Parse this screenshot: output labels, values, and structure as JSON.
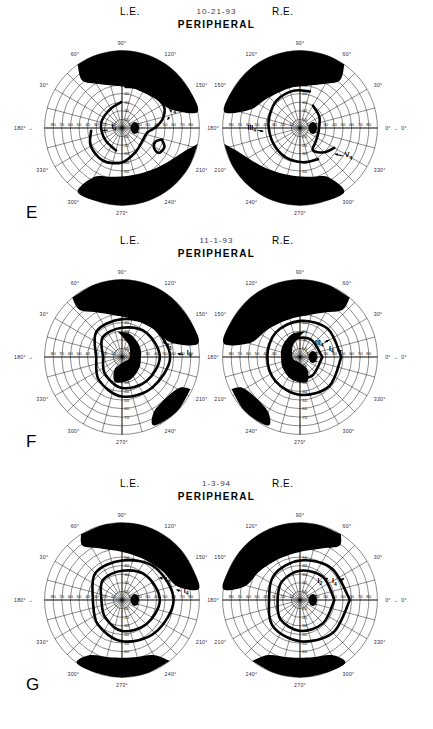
{
  "document": {
    "title": "Goldmann Kinetic Perimetry Series",
    "test_type": "PERIPHERAL",
    "eye_left_label": "L.E.",
    "eye_right_label": "R.E."
  },
  "panels": [
    {
      "letter": "E",
      "date": "10-21-93",
      "test_type": "PERIPHERAL",
      "left_eye": {
        "label": "L.E.",
        "isopter_labels": [
          {
            "name": "III",
            "sub": "4"
          },
          {
            "name": "V",
            "sub": "4"
          },
          {
            "name": "I",
            "sub": "4"
          }
        ]
      },
      "right_eye": {
        "label": "R.E.",
        "isopter_labels": [
          {
            "name": "III",
            "sub": "4"
          },
          {
            "name": "V",
            "sub": "4"
          }
        ]
      }
    },
    {
      "letter": "F",
      "date": "11-1-93",
      "test_type": "PERIPHERAL",
      "left_eye": {
        "label": "L.E.",
        "isopter_labels": [
          {
            "name": "I",
            "sub": "4"
          },
          {
            "name": "I",
            "sub": "3"
          },
          {
            "name": "I",
            "sub": "4"
          }
        ]
      },
      "right_eye": {
        "label": "R.E.",
        "isopter_labels": [
          {
            "name": "III",
            "sub": "4"
          },
          {
            "name": "I",
            "sub": "3"
          },
          {
            "name": "I",
            "sub": "4"
          }
        ]
      }
    },
    {
      "letter": "G",
      "date": "1-3-94",
      "test_type": "PERIPHERAL",
      "left_eye": {
        "label": "L.E.",
        "isopter_labels": [
          {
            "name": "I",
            "sub": "4"
          },
          {
            "name": "I",
            "sub": "2"
          }
        ]
      },
      "right_eye": {
        "label": "R.E.",
        "isopter_labels": [
          {
            "name": "I",
            "sub": "2"
          },
          {
            "name": "I",
            "sub": "4"
          }
        ]
      }
    }
  ],
  "chart_data": {
    "type": "scatter",
    "subtitle": "Serial visual fields E (10-21-93), F (11-1-93), G (1-3-94)",
    "projection": "polar",
    "radial_axis": {
      "label": "Eccentricity (degrees)",
      "ticks": [
        10,
        20,
        30,
        40,
        50,
        60,
        70,
        80,
        90
      ],
      "range": [
        0,
        90
      ],
      "ring_interval": 10
    },
    "angular_axis": {
      "label": "Meridian (degrees)",
      "ticks": [
        0,
        30,
        60,
        90,
        120,
        150,
        180,
        210,
        240,
        270,
        300,
        330
      ],
      "tick_labels": [
        "0°",
        "30°",
        "60°",
        "90°",
        "120°",
        "150°",
        "180°",
        "210°",
        "240°",
        "270°",
        "300°",
        "330°"
      ],
      "spoke_interval": 15
    },
    "meridian_markers": {
      "left_arrow_label": "180°",
      "right_arrow_label": "0°"
    },
    "legend_position": "inline-annotations",
    "grid": true,
    "series": [
      {
        "name": "E / L.E. III4",
        "panel": "E",
        "eye": "left",
        "stimulus": "III4",
        "closed": false,
        "points_deg": [
          {
            "angle": 95,
            "r": 48
          },
          {
            "angle": 120,
            "r": 52
          },
          {
            "angle": 150,
            "r": 55
          },
          {
            "angle": 165,
            "r": 50
          },
          {
            "angle": 178,
            "r": 40
          },
          {
            "angle": 190,
            "r": 30
          },
          {
            "angle": 210,
            "r": 28
          },
          {
            "angle": 240,
            "r": 32
          },
          {
            "angle": 270,
            "r": 40
          },
          {
            "angle": 300,
            "r": 44
          },
          {
            "angle": 330,
            "r": 42
          },
          {
            "angle": 355,
            "r": 36
          }
        ]
      },
      {
        "name": "E / L.E. V4 island",
        "panel": "E",
        "eye": "left",
        "stimulus": "V4",
        "closed": true,
        "points_deg": [
          {
            "angle": 196,
            "r": 48
          },
          {
            "angle": 204,
            "r": 54
          },
          {
            "angle": 214,
            "r": 52
          },
          {
            "angle": 212,
            "r": 44
          },
          {
            "angle": 202,
            "r": 42
          }
        ]
      },
      {
        "name": "E / L.E. I4",
        "panel": "E",
        "eye": "left",
        "stimulus": "I4",
        "closed": false,
        "points_deg": [
          {
            "angle": 88,
            "r": 30
          },
          {
            "angle": 60,
            "r": 26
          },
          {
            "angle": 20,
            "r": 25
          },
          {
            "angle": 350,
            "r": 24
          },
          {
            "angle": 320,
            "r": 24
          },
          {
            "angle": 285,
            "r": 27
          }
        ]
      },
      {
        "name": "E / R.E. III4",
        "panel": "E",
        "eye": "right",
        "stimulus": "III4",
        "closed": false,
        "points_deg": [
          {
            "angle": 75,
            "r": 44
          },
          {
            "angle": 100,
            "r": 44
          },
          {
            "angle": 130,
            "r": 42
          },
          {
            "angle": 160,
            "r": 38
          },
          {
            "angle": 185,
            "r": 36
          },
          {
            "angle": 215,
            "r": 36
          },
          {
            "angle": 245,
            "r": 38
          },
          {
            "angle": 275,
            "r": 40
          },
          {
            "angle": 300,
            "r": 42
          }
        ]
      },
      {
        "name": "E / R.E. V4",
        "panel": "E",
        "eye": "right",
        "stimulus": "V4",
        "closed": false,
        "points_deg": [
          {
            "angle": 60,
            "r": 30
          },
          {
            "angle": 30,
            "r": 26
          },
          {
            "angle": 350,
            "r": 22
          },
          {
            "angle": 320,
            "r": 24
          },
          {
            "angle": 300,
            "r": 30
          },
          {
            "angle": 315,
            "r": 40
          },
          {
            "angle": 330,
            "r": 46
          }
        ]
      },
      {
        "name": "F / L.E. I4 outer",
        "panel": "F",
        "eye": "left",
        "stimulus": "I4",
        "closed": true,
        "points_deg": [
          {
            "angle": 0,
            "r": 30
          },
          {
            "angle": 45,
            "r": 42
          },
          {
            "angle": 90,
            "r": 44
          },
          {
            "angle": 135,
            "r": 50
          },
          {
            "angle": 180,
            "r": 56
          },
          {
            "angle": 225,
            "r": 50
          },
          {
            "angle": 270,
            "r": 46
          },
          {
            "angle": 315,
            "r": 38
          }
        ]
      },
      {
        "name": "F / L.E. I3",
        "panel": "F",
        "eye": "left",
        "stimulus": "I3",
        "closed": true,
        "points_deg": [
          {
            "angle": 0,
            "r": 22
          },
          {
            "angle": 45,
            "r": 32
          },
          {
            "angle": 90,
            "r": 34
          },
          {
            "angle": 135,
            "r": 40
          },
          {
            "angle": 180,
            "r": 44
          },
          {
            "angle": 225,
            "r": 40
          },
          {
            "angle": 270,
            "r": 36
          },
          {
            "angle": 315,
            "r": 28
          }
        ]
      },
      {
        "name": "F / R.E. III4",
        "panel": "F",
        "eye": "right",
        "stimulus": "III4",
        "closed": true,
        "points_deg": [
          {
            "angle": 0,
            "r": 48
          },
          {
            "angle": 45,
            "r": 46
          },
          {
            "angle": 90,
            "r": 42
          },
          {
            "angle": 135,
            "r": 40
          },
          {
            "angle": 180,
            "r": 38
          },
          {
            "angle": 225,
            "r": 40
          },
          {
            "angle": 270,
            "r": 44
          },
          {
            "angle": 315,
            "r": 48
          }
        ]
      },
      {
        "name": "F / R.E. I3",
        "panel": "F",
        "eye": "right",
        "stimulus": "I3",
        "closed": true,
        "points_deg": [
          {
            "angle": 0,
            "r": 26
          },
          {
            "angle": 60,
            "r": 24
          },
          {
            "angle": 120,
            "r": 22
          },
          {
            "angle": 180,
            "r": 20
          },
          {
            "angle": 240,
            "r": 24
          },
          {
            "angle": 300,
            "r": 26
          }
        ]
      },
      {
        "name": "G / L.E. I4",
        "panel": "G",
        "eye": "left",
        "stimulus": "I4",
        "closed": true,
        "points_deg": [
          {
            "angle": 0,
            "r": 34
          },
          {
            "angle": 45,
            "r": 44
          },
          {
            "angle": 90,
            "r": 46
          },
          {
            "angle": 135,
            "r": 54
          },
          {
            "angle": 180,
            "r": 60
          },
          {
            "angle": 225,
            "r": 54
          },
          {
            "angle": 270,
            "r": 48
          },
          {
            "angle": 315,
            "r": 40
          }
        ]
      },
      {
        "name": "G / L.E. I2",
        "panel": "G",
        "eye": "left",
        "stimulus": "I2",
        "closed": true,
        "points_deg": [
          {
            "angle": 0,
            "r": 24
          },
          {
            "angle": 45,
            "r": 32
          },
          {
            "angle": 90,
            "r": 34
          },
          {
            "angle": 135,
            "r": 40
          },
          {
            "angle": 180,
            "r": 44
          },
          {
            "angle": 225,
            "r": 40
          },
          {
            "angle": 270,
            "r": 36
          },
          {
            "angle": 315,
            "r": 28
          }
        ]
      },
      {
        "name": "G / R.E. I4",
        "panel": "G",
        "eye": "right",
        "stimulus": "I4",
        "closed": true,
        "points_deg": [
          {
            "angle": 0,
            "r": 58
          },
          {
            "angle": 45,
            "r": 52
          },
          {
            "angle": 90,
            "r": 46
          },
          {
            "angle": 135,
            "r": 42
          },
          {
            "angle": 180,
            "r": 36
          },
          {
            "angle": 225,
            "r": 44
          },
          {
            "angle": 270,
            "r": 48
          },
          {
            "angle": 315,
            "r": 54
          }
        ]
      },
      {
        "name": "G / R.E. I2",
        "panel": "G",
        "eye": "right",
        "stimulus": "I2",
        "closed": true,
        "points_deg": [
          {
            "angle": 0,
            "r": 40
          },
          {
            "angle": 45,
            "r": 38
          },
          {
            "angle": 90,
            "r": 34
          },
          {
            "angle": 135,
            "r": 30
          },
          {
            "angle": 180,
            "r": 26
          },
          {
            "angle": 225,
            "r": 32
          },
          {
            "angle": 270,
            "r": 36
          },
          {
            "angle": 315,
            "r": 38
          }
        ]
      }
    ],
    "scotomata": [
      {
        "panel": "E",
        "eye": "left",
        "region": "superior",
        "description": "dense superior altitudinal defect"
      },
      {
        "panel": "E",
        "eye": "left",
        "region": "inferior",
        "description": "dense inferior defect"
      },
      {
        "panel": "E",
        "eye": "right",
        "region": "superior",
        "description": "dense superior altitudinal defect"
      },
      {
        "panel": "E",
        "eye": "right",
        "region": "inferior",
        "description": "dense inferior defect"
      },
      {
        "panel": "F",
        "eye": "left",
        "region": "superior",
        "description": "dense superior defect"
      },
      {
        "panel": "F",
        "eye": "left",
        "region": "central",
        "description": "central scotoma"
      },
      {
        "panel": "F",
        "eye": "right",
        "region": "superior",
        "description": "dense superior defect"
      },
      {
        "panel": "F",
        "eye": "right",
        "region": "central",
        "description": "central scotoma"
      },
      {
        "panel": "G",
        "eye": "left",
        "region": "superior",
        "description": "dense superior defect"
      },
      {
        "panel": "G",
        "eye": "right",
        "region": "superior",
        "description": "dense superior defect"
      }
    ],
    "blind_spots": [
      {
        "panel": "E",
        "eye": "left",
        "angle": 180,
        "r": 15
      },
      {
        "panel": "E",
        "eye": "right",
        "angle": 0,
        "r": 15
      },
      {
        "panel": "F",
        "eye": "left",
        "angle": 180,
        "r": 15
      },
      {
        "panel": "F",
        "eye": "right",
        "angle": 0,
        "r": 15
      },
      {
        "panel": "G",
        "eye": "left",
        "angle": 180,
        "r": 15
      },
      {
        "panel": "G",
        "eye": "right",
        "angle": 0,
        "r": 15
      }
    ]
  }
}
